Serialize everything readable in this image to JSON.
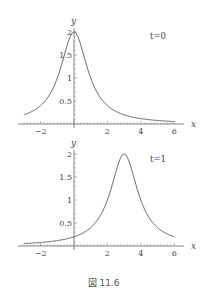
{
  "chart_data": [
    {
      "type": "line",
      "title": "",
      "annotation": "t=0",
      "xlabel": "x",
      "ylabel": "y",
      "xlim": [
        -3,
        6
      ],
      "ylim": [
        0,
        2
      ],
      "x_ticks": [
        "-2",
        "2",
        "4",
        "6"
      ],
      "y_ticks": [
        "0.5",
        "1",
        "1.5",
        "2"
      ],
      "grid": false,
      "function": "y = 2/(1+(x-3t)^2), t=0",
      "series": [
        {
          "name": "t=0",
          "x": [
            -3,
            -2,
            -1,
            -0.5,
            0,
            0.5,
            1,
            2,
            3,
            4,
            5,
            6
          ],
          "y": [
            0.2,
            0.4,
            1.0,
            1.6,
            2.0,
            1.6,
            1.0,
            0.4,
            0.2,
            0.118,
            0.077,
            0.054
          ]
        }
      ]
    },
    {
      "type": "line",
      "title": "",
      "annotation": "t=1",
      "xlabel": "x",
      "ylabel": "y",
      "xlim": [
        -3,
        6
      ],
      "ylim": [
        0,
        2
      ],
      "x_ticks": [
        "-2",
        "2",
        "4",
        "6"
      ],
      "y_ticks": [
        "0.5",
        "1",
        "1.5",
        "2"
      ],
      "grid": false,
      "function": "y = 2/(1+(x-3t)^2), t=1",
      "series": [
        {
          "name": "t=1",
          "x": [
            -3,
            -2,
            -1,
            0,
            1,
            2,
            2.5,
            3,
            3.5,
            4,
            5,
            6
          ],
          "y": [
            0.054,
            0.077,
            0.118,
            0.2,
            0.4,
            1.0,
            1.6,
            2.0,
            1.6,
            1.0,
            0.4,
            0.2
          ]
        }
      ]
    }
  ],
  "labels": {
    "plot1_annotation": "t=0",
    "plot2_annotation": "t=1",
    "x_axis": "x",
    "y_axis": "y",
    "x_tick_m2": "−2",
    "x_tick_2": "2",
    "x_tick_4": "4",
    "x_tick_6": "6",
    "y_tick_05": "0.5",
    "y_tick_1": "1",
    "y_tick_15": "1.5",
    "y_tick_2": "2"
  },
  "caption": "図 11.6"
}
